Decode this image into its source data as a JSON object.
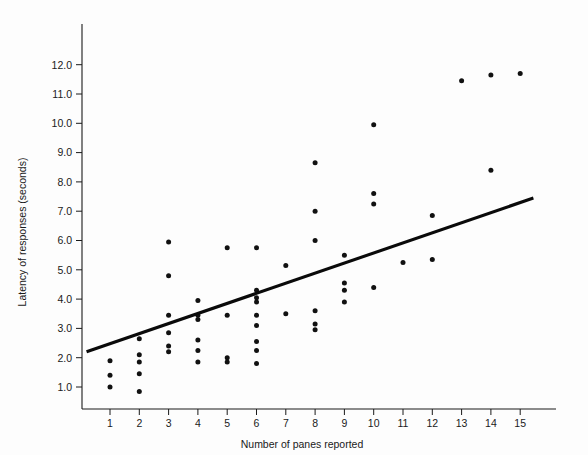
{
  "chart_data": {
    "type": "scatter",
    "title": "",
    "xlabel": "Number of panes reported",
    "ylabel": "Latency of responses (seconds)",
    "xlim": [
      0.2,
      15.8
    ],
    "ylim": [
      0.2,
      12.9
    ],
    "xticks": [
      1,
      2,
      3,
      4,
      5,
      6,
      7,
      8,
      9,
      10,
      11,
      12,
      13,
      14,
      15
    ],
    "xticklabels": [
      "1",
      "2",
      "3",
      "4",
      "5",
      "6",
      "7",
      "8",
      "9",
      "10",
      "11",
      "12",
      "13",
      "14",
      "15"
    ],
    "yticks": [
      1.0,
      2.0,
      3.0,
      4.0,
      5.0,
      6.0,
      7.0,
      8.0,
      9.0,
      10.0,
      11.0,
      12.0
    ],
    "yticklabels": [
      "1.0",
      "2.0",
      "3.0",
      "4.0",
      "5.0",
      "6.0",
      "7.0",
      "8.0",
      "9.0",
      "10.0",
      "11.0",
      "12.0"
    ],
    "grid": false,
    "legend": false,
    "marker_color": "#111111",
    "line_color": "#0a0a0a",
    "points": [
      {
        "x": 1,
        "y": 1.9
      },
      {
        "x": 1,
        "y": 1.4
      },
      {
        "x": 1,
        "y": 1.0
      },
      {
        "x": 2,
        "y": 2.65
      },
      {
        "x": 2,
        "y": 2.1
      },
      {
        "x": 2,
        "y": 1.85
      },
      {
        "x": 2,
        "y": 1.45
      },
      {
        "x": 2,
        "y": 0.85
      },
      {
        "x": 3,
        "y": 5.95
      },
      {
        "x": 3,
        "y": 4.8
      },
      {
        "x": 3,
        "y": 3.45
      },
      {
        "x": 3,
        "y": 2.85
      },
      {
        "x": 3,
        "y": 2.4
      },
      {
        "x": 3,
        "y": 2.2
      },
      {
        "x": 4,
        "y": 3.95
      },
      {
        "x": 4,
        "y": 3.45
      },
      {
        "x": 4,
        "y": 3.3
      },
      {
        "x": 4,
        "y": 2.6
      },
      {
        "x": 4,
        "y": 2.25
      },
      {
        "x": 4,
        "y": 1.85
      },
      {
        "x": 5,
        "y": 5.75
      },
      {
        "x": 5,
        "y": 3.45
      },
      {
        "x": 5,
        "y": 2.0
      },
      {
        "x": 5,
        "y": 1.85
      },
      {
        "x": 6,
        "y": 5.75
      },
      {
        "x": 6,
        "y": 4.3
      },
      {
        "x": 6,
        "y": 4.05
      },
      {
        "x": 6,
        "y": 3.9
      },
      {
        "x": 6,
        "y": 3.45
      },
      {
        "x": 6,
        "y": 3.1
      },
      {
        "x": 6,
        "y": 2.55
      },
      {
        "x": 6,
        "y": 2.25
      },
      {
        "x": 6,
        "y": 1.8
      },
      {
        "x": 7,
        "y": 5.15
      },
      {
        "x": 7,
        "y": 3.5
      },
      {
        "x": 8,
        "y": 8.65
      },
      {
        "x": 8,
        "y": 7.0
      },
      {
        "x": 8,
        "y": 6.0
      },
      {
        "x": 8,
        "y": 3.6
      },
      {
        "x": 8,
        "y": 3.15
      },
      {
        "x": 8,
        "y": 2.95
      },
      {
        "x": 9,
        "y": 5.5
      },
      {
        "x": 9,
        "y": 4.55
      },
      {
        "x": 9,
        "y": 4.3
      },
      {
        "x": 9,
        "y": 3.9
      },
      {
        "x": 10,
        "y": 9.95
      },
      {
        "x": 10,
        "y": 7.6
      },
      {
        "x": 10,
        "y": 7.25
      },
      {
        "x": 10,
        "y": 4.4
      },
      {
        "x": 11,
        "y": 5.25
      },
      {
        "x": 12,
        "y": 6.85
      },
      {
        "x": 12,
        "y": 5.35
      },
      {
        "x": 13,
        "y": 11.45
      },
      {
        "x": 14,
        "y": 11.65
      },
      {
        "x": 14,
        "y": 8.4
      },
      {
        "x": 15,
        "y": 11.7
      }
    ],
    "fit_line": {
      "name": "regression-line",
      "x_start": 0.2,
      "y_start": 2.2,
      "x_end": 15.45,
      "y_end": 7.45
    }
  }
}
